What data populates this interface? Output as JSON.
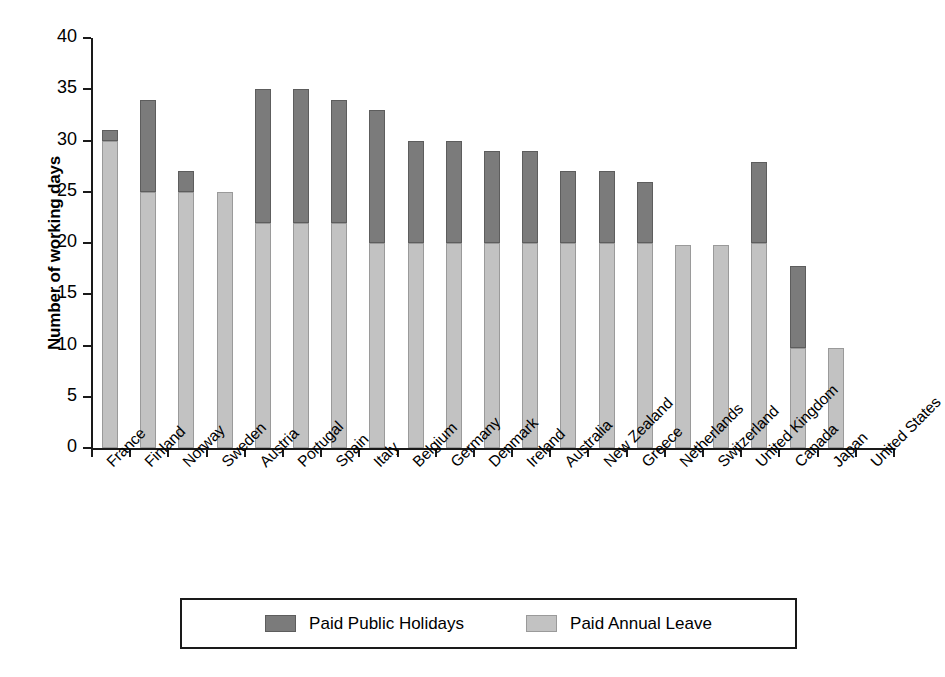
{
  "chart_data": {
    "type": "bar",
    "title": "",
    "subtitle": "",
    "xlabel": "",
    "ylabel": "Number of working days",
    "ylim": [
      0,
      40
    ],
    "yticks": [
      0,
      5,
      10,
      15,
      20,
      25,
      30,
      35,
      40
    ],
    "ytick_labels": [
      "0",
      "5",
      "10",
      "15",
      "20",
      "25",
      "30",
      "35",
      "40"
    ],
    "grid": false,
    "stacked": true,
    "legend_position": "bottom",
    "categories": [
      "France",
      "Finland",
      "Norway",
      "Sweden",
      "Austria",
      "Portugal",
      "Spain",
      "Italy",
      "Belgium",
      "Germany",
      "Denmark",
      "Ireland",
      "Australia",
      "New Zealand",
      "Greece",
      "Netherlands",
      "Switzerland",
      "United Kingdom",
      "Canada",
      "Japan",
      "United States"
    ],
    "series": [
      {
        "name": "Paid Annual Leave",
        "color": "#c2c2c2",
        "values": [
          30,
          25,
          25,
          25,
          22,
          22,
          22,
          20,
          20,
          20,
          20,
          20,
          20,
          20,
          20,
          19.8,
          19.8,
          20,
          9.8,
          9.8,
          0
        ]
      },
      {
        "name": "Paid Public Holidays",
        "color": "#7b7b7b",
        "values": [
          1,
          9,
          2,
          0,
          13,
          13,
          12,
          13,
          10,
          10,
          9,
          9,
          7,
          7,
          6,
          0,
          0,
          7.9,
          8,
          0,
          0
        ]
      }
    ],
    "totals": [
      31,
      34,
      27,
      25,
      35,
      35,
      34,
      33,
      30,
      30,
      29,
      29,
      27,
      27,
      26,
      19.8,
      19.8,
      27.9,
      17.8,
      9.8,
      0
    ]
  },
  "legend": {
    "items": [
      {
        "label": "Paid Public Holidays",
        "swatch": "dark"
      },
      {
        "label": "Paid Annual Leave",
        "swatch": "light"
      }
    ]
  }
}
